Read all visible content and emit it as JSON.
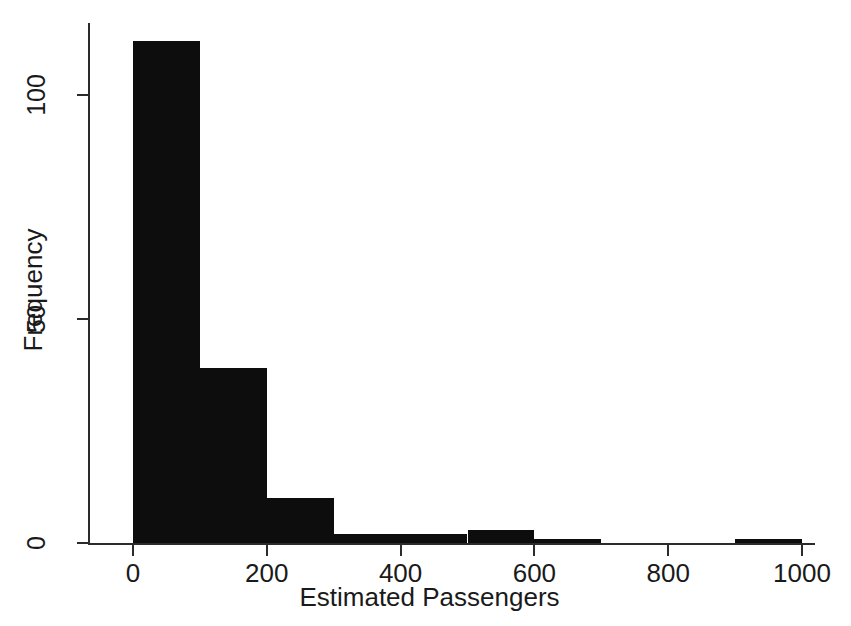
{
  "chart_data": {
    "type": "bar",
    "title": "",
    "subtitle": "",
    "xlabel": "Estimated Passengers",
    "ylabel": "Frequency",
    "xlim": [
      0,
      1000
    ],
    "ylim": [
      0,
      115
    ],
    "grid": false,
    "legend": null,
    "bin_width": 100,
    "categories": [
      "0-100",
      "100-200",
      "200-300",
      "300-400",
      "400-500",
      "500-600",
      "600-700",
      "700-800",
      "800-900",
      "900-1000"
    ],
    "bin_edges": [
      0,
      100,
      200,
      300,
      400,
      500,
      600,
      700,
      800,
      900,
      1000
    ],
    "values": [
      112,
      39,
      10,
      2,
      2,
      3,
      1,
      0,
      0,
      1
    ],
    "x_ticks": [
      {
        "value": 0,
        "label": "0"
      },
      {
        "value": 200,
        "label": "200"
      },
      {
        "value": 400,
        "label": "400"
      },
      {
        "value": 600,
        "label": "600"
      },
      {
        "value": 800,
        "label": "800"
      },
      {
        "value": 1000,
        "label": "1000"
      }
    ],
    "y_ticks": [
      {
        "value": 0,
        "label": "0"
      },
      {
        "value": 50,
        "label": "50"
      },
      {
        "value": 100,
        "label": "100"
      }
    ],
    "bar_color": "#0d0d0d",
    "axis_color": "#2b2b2b",
    "background_color": "#ffffff"
  }
}
